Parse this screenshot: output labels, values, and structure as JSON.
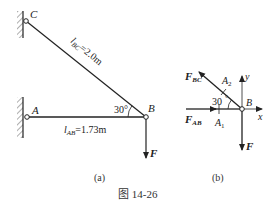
{
  "figure": {
    "caption": "图 14-26",
    "panel_a": {
      "label": "(a)",
      "points": {
        "C": "C",
        "A": "A",
        "B": "B"
      },
      "bar_bc_length": "l_BC=2.0m",
      "bar_bc_length_parts": {
        "l": "l",
        "sub": "BC",
        "rest": "=2.0m"
      },
      "bar_ab_length_parts": {
        "l": "l",
        "sub": "AB",
        "rest": "=1.73m"
      },
      "angle": "30°",
      "angle_text": "30",
      "load": "F"
    },
    "panel_b": {
      "label": "(b)",
      "point": "B",
      "force_bc": {
        "main": "F",
        "sub": "BC"
      },
      "force_ab": {
        "main": "F",
        "sub": "AB"
      },
      "load": "F",
      "axis_x": "x",
      "axis_y": "y",
      "angle_text": "30",
      "section_a1": {
        "main": "A",
        "sub": "1"
      },
      "section_a2": {
        "main": "A",
        "sub": "2"
      }
    },
    "colors": {
      "ink": "#222222",
      "background": "#ffffff"
    }
  }
}
